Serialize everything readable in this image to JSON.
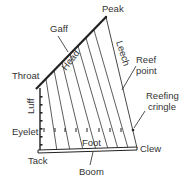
{
  "diagram": {
    "labels": {
      "peak": "Peak",
      "gaff": "Gaff",
      "head": "Head",
      "leech": "Leech",
      "throat": "Throat",
      "reef_point": [
        "Reef",
        "point"
      ],
      "luff": "Luff",
      "reefing_cringle": [
        "Reefing",
        "cringle"
      ],
      "eyelet": "Eyelet",
      "foot": "Foot",
      "clew": "Clew",
      "tack": "Tack",
      "boom": "Boom"
    },
    "colors": {
      "line": "#222222",
      "text": "#333333",
      "background": "#ffffff"
    }
  }
}
